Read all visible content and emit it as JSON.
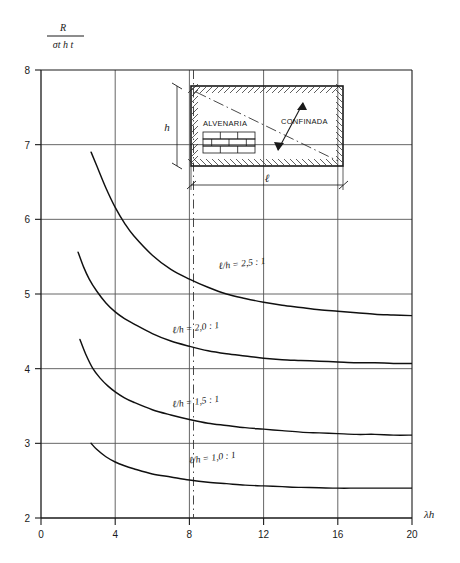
{
  "chart_data": {
    "type": "line",
    "title": "",
    "xlabel": "λh",
    "ylabel": "R / (σt h t)",
    "ylabel_numerator": "R",
    "ylabel_denominator": "σt h t",
    "xlim": [
      0,
      20
    ],
    "ylim": [
      2,
      8
    ],
    "xticks": [
      0,
      4,
      8,
      12,
      16,
      20
    ],
    "xtick_labels": [
      "0",
      "4",
      "8",
      "12",
      "16",
      "20"
    ],
    "yticks": [
      2,
      3,
      4,
      5,
      6,
      7,
      8
    ],
    "ytick_labels": [
      "2",
      "3",
      "4",
      "5",
      "6",
      "7",
      "8"
    ],
    "grid": true,
    "grid_style": "horizontal gridlines at every y integer; vertical gridlines at x = 4, 8, 12, 16",
    "legend": "inline curve labels",
    "series": [
      {
        "name": "ℓ/h = 2,5 : 1",
        "label": "ℓ/h = 2,5 : 1",
        "label_x": 9.6,
        "label_y": 5.33,
        "x": [
          2.7,
          3.0,
          3.5,
          4.0,
          4.5,
          5.0,
          6.0,
          7.0,
          8.0,
          9.0,
          10.0,
          11.0,
          12.0,
          13.0,
          14.0,
          15.0,
          16.0,
          17.0,
          18.0,
          19.0,
          20.0
        ],
        "y": [
          6.9,
          6.72,
          6.42,
          6.16,
          5.95,
          5.78,
          5.52,
          5.33,
          5.2,
          5.09,
          5.0,
          4.94,
          4.89,
          4.85,
          4.82,
          4.79,
          4.77,
          4.75,
          4.73,
          4.72,
          4.71
        ]
      },
      {
        "name": "ℓ/h = 2,0 : 1",
        "label": "ℓ/h = 2,0 : 1",
        "label_x": 7.1,
        "label_y": 4.47,
        "x": [
          2.0,
          2.3,
          2.6,
          3.0,
          3.5,
          4.0,
          4.5,
          5.0,
          6.0,
          7.0,
          8.0,
          9.0,
          10.0,
          11.0,
          12.0,
          13.0,
          14.0,
          15.0,
          16.0,
          17.0,
          18.0,
          19.0,
          20.0
        ],
        "y": [
          5.56,
          5.36,
          5.2,
          5.04,
          4.88,
          4.76,
          4.67,
          4.6,
          4.47,
          4.37,
          4.3,
          4.24,
          4.2,
          4.17,
          4.14,
          4.12,
          4.11,
          4.1,
          4.09,
          4.08,
          4.08,
          4.07,
          4.07
        ]
      },
      {
        "name": "ℓ/h = 1,5 : 1",
        "label": "ℓ/h = 1,5 : 1",
        "label_x": 7.1,
        "label_y": 3.48,
        "x": [
          2.1,
          2.4,
          2.8,
          3.2,
          3.6,
          4.0,
          4.5,
          5.0,
          6.0,
          7.0,
          8.0,
          9.0,
          10.0,
          11.0,
          12.0,
          13.0,
          14.0,
          15.0,
          16.0,
          17.0,
          18.0,
          19.0,
          20.0
        ],
        "y": [
          4.39,
          4.2,
          4.0,
          3.87,
          3.77,
          3.69,
          3.61,
          3.55,
          3.45,
          3.38,
          3.32,
          3.27,
          3.24,
          3.21,
          3.19,
          3.17,
          3.15,
          3.14,
          3.13,
          3.12,
          3.12,
          3.11,
          3.11
        ]
      },
      {
        "name": "ℓ/h = 1,0 : 1",
        "label": "ℓ/h = 1,0 : 1",
        "label_x": 8.0,
        "label_y": 2.73,
        "x": [
          2.7,
          3.0,
          3.5,
          4.0,
          4.5,
          5.0,
          6.0,
          7.0,
          8.0,
          9.0,
          10.0,
          11.0,
          12.0,
          13.0,
          14.0,
          15.0,
          16.0,
          17.0,
          18.0,
          19.0,
          20.0
        ],
        "y": [
          3.0,
          2.92,
          2.82,
          2.75,
          2.7,
          2.66,
          2.59,
          2.55,
          2.51,
          2.48,
          2.46,
          2.44,
          2.43,
          2.42,
          2.41,
          2.405,
          2.4,
          2.4,
          2.4,
          2.4,
          2.4
        ]
      }
    ],
    "annotations": [
      {
        "name": "center-dash-dot-line",
        "type": "vertical dash-dot",
        "x": 8
      }
    ]
  },
  "inset": {
    "title_left": "ALVENARIA",
    "title_right": "CONFINADA",
    "dim_height_label": "h",
    "dim_length_label": "ℓ",
    "description": "rectangular confined masonry panel with hatched boundary frame, brick pattern, and diagonal compression strut"
  },
  "colors": {
    "ink": "#1a1a1a",
    "grid": "#555555",
    "curve": "#101010",
    "background": "#ffffff"
  }
}
